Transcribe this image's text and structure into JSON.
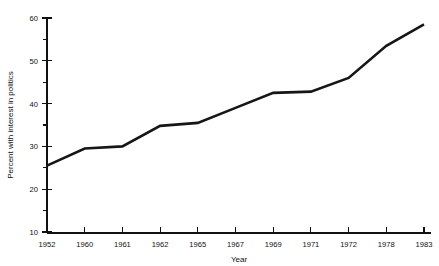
{
  "chart_data": {
    "type": "line",
    "title": "",
    "xlabel": "Year",
    "ylabel": "Percent with interest in politics",
    "x": [
      "1952",
      "1960",
      "1961",
      "1962",
      "1965",
      "1967",
      "1969",
      "1971",
      "1972",
      "1978",
      "1983"
    ],
    "categories": [
      "1952",
      "1960",
      "1961",
      "1962",
      "1965",
      "1967",
      "1969",
      "1971",
      "1972",
      "1978",
      "1983"
    ],
    "values": [
      25.5,
      29.5,
      30.0,
      34.8,
      35.5,
      39.0,
      42.5,
      42.8,
      46.0,
      53.5,
      58.5
    ],
    "series": [
      {
        "name": "Percent with interest in politics",
        "values": [
          25.5,
          29.5,
          30.0,
          34.8,
          35.5,
          39.0,
          42.5,
          42.8,
          46.0,
          53.5,
          58.5
        ]
      }
    ],
    "ylim": [
      10,
      60
    ],
    "ytick_major": [
      10,
      20,
      30,
      40,
      50,
      60
    ],
    "ytick_minor": [
      15,
      25,
      35,
      45,
      55
    ],
    "ytick_labels": [
      "10",
      "20",
      "30",
      "40",
      "50",
      "60"
    ],
    "grid": false,
    "legend": false,
    "legend_position": "none",
    "line_color": "#161616",
    "axis_color": "#111111"
  },
  "axes": {
    "y_title": "Percent with interest in politics",
    "x_title": "Year"
  }
}
